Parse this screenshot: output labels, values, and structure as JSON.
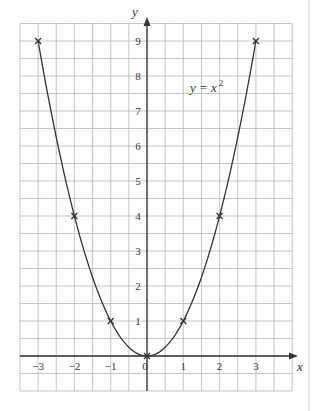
{
  "chart_data": {
    "type": "line",
    "title": "",
    "equation_label": {
      "lhs": "y = x",
      "exponent": "2"
    },
    "xlabel": "x",
    "ylabel": "y",
    "x": [
      -3,
      -2,
      -1,
      0,
      1,
      2,
      3
    ],
    "series": [
      {
        "name": "y = x^2",
        "values": [
          9,
          4,
          1,
          0,
          1,
          4,
          9
        ],
        "marker": "x",
        "curve": "smooth"
      }
    ],
    "x_ticks": [
      -3,
      -2,
      -1,
      0,
      1,
      2,
      3
    ],
    "y_ticks": [
      1,
      2,
      3,
      4,
      5,
      6,
      7,
      8,
      9
    ],
    "x_tick_labels": [
      "−3",
      "−2",
      "−1",
      "0",
      "1",
      "2",
      "3"
    ],
    "y_tick_labels": [
      "1",
      "2",
      "3",
      "4",
      "5",
      "6",
      "7",
      "8",
      "9"
    ],
    "xlim": [
      -3.5,
      4
    ],
    "ylim": [
      -1,
      9.5
    ],
    "grid": true,
    "grid_step": 0.5,
    "legend": "none"
  },
  "colors": {
    "grid": "#b8b8b8",
    "axis": "#333333",
    "curve": "#333333",
    "text": "#333333",
    "border": "#cfcfcf"
  }
}
